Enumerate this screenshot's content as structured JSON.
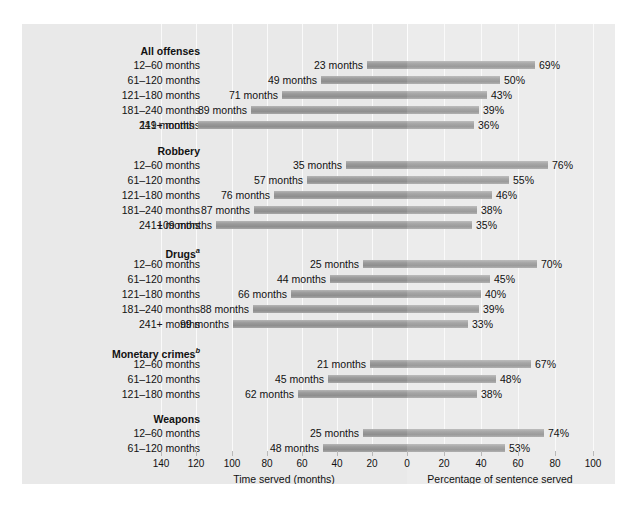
{
  "chart_data": {
    "type": "bar",
    "title": "",
    "orientation": "horizontal-bidirectional",
    "left_axis": {
      "xlabel": "Time served (months)",
      "ticks": [
        140,
        120,
        100,
        80,
        60,
        40,
        20,
        0
      ],
      "direction": "right-to-left",
      "xlim": [
        0,
        140
      ]
    },
    "right_axis": {
      "xlabel": "Percentage of sentence served",
      "ticks": [
        0,
        20,
        40,
        60,
        80,
        100
      ],
      "direction": "left-to-right",
      "xlim": [
        0,
        100
      ]
    },
    "series": [
      {
        "name": "Time served (months)",
        "unit": "months"
      },
      {
        "name": "Percentage of sentence served",
        "unit": "%"
      }
    ],
    "groups": [
      {
        "label": "All offenses",
        "footnote": "",
        "rows": [
          {
            "category": "12–60 months",
            "months": 23,
            "months_label": "23 months",
            "percent": 69,
            "percent_label": "69%"
          },
          {
            "category": "61–120 months",
            "months": 49,
            "months_label": "49 months",
            "percent": 50,
            "percent_label": "50%"
          },
          {
            "category": "121–180 months",
            "months": 71,
            "months_label": "71 months",
            "percent": 43,
            "percent_label": "43%"
          },
          {
            "category": "181–240 months",
            "months": 89,
            "months_label": "89 months",
            "percent": 39,
            "percent_label": "39%"
          },
          {
            "category": "241+ months",
            "months": 119,
            "months_label": "119 months",
            "percent": 36,
            "percent_label": "36%"
          }
        ]
      },
      {
        "label": "Robbery",
        "footnote": "",
        "rows": [
          {
            "category": "12–60 months",
            "months": 35,
            "months_label": "35 months",
            "percent": 76,
            "percent_label": "76%"
          },
          {
            "category": "61–120 months",
            "months": 57,
            "months_label": "57 months",
            "percent": 55,
            "percent_label": "55%"
          },
          {
            "category": "121–180 months",
            "months": 76,
            "months_label": "76 months",
            "percent": 46,
            "percent_label": "46%"
          },
          {
            "category": "181–240 months",
            "months": 87,
            "months_label": "87 months",
            "percent": 38,
            "percent_label": "38%"
          },
          {
            "category": "241+ months",
            "months": 109,
            "months_label": "109 months",
            "percent": 35,
            "percent_label": "35%"
          }
        ]
      },
      {
        "label": "Drugs",
        "footnote": "a",
        "rows": [
          {
            "category": "12–60 months",
            "months": 25,
            "months_label": "25 months",
            "percent": 70,
            "percent_label": "70%"
          },
          {
            "category": "61–120 months",
            "months": 44,
            "months_label": "44 months",
            "percent": 45,
            "percent_label": "45%"
          },
          {
            "category": "121–180 months",
            "months": 66,
            "months_label": "66 months",
            "percent": 40,
            "percent_label": "40%"
          },
          {
            "category": "181–240 months",
            "months": 88,
            "months_label": "88 months",
            "percent": 39,
            "percent_label": "39%"
          },
          {
            "category": "241+ months",
            "months": 99,
            "months_label": "99 months",
            "percent": 33,
            "percent_label": "33%"
          }
        ]
      },
      {
        "label": "Monetary crimes",
        "footnote": "b",
        "rows": [
          {
            "category": "12–60 months",
            "months": 21,
            "months_label": "21 months",
            "percent": 67,
            "percent_label": "67%"
          },
          {
            "category": "61–120 months",
            "months": 45,
            "months_label": "45 months",
            "percent": 48,
            "percent_label": "48%"
          },
          {
            "category": "121–180 months",
            "months": 62,
            "months_label": "62 months",
            "percent": 38,
            "percent_label": "38%"
          }
        ]
      },
      {
        "label": "Weapons",
        "footnote": "",
        "rows": [
          {
            "category": "12–60 months",
            "months": 25,
            "months_label": "25 months",
            "percent": 74,
            "percent_label": "74%"
          },
          {
            "category": "61–120 months",
            "months": 48,
            "months_label": "48 months",
            "percent": 53,
            "percent_label": "53%"
          }
        ]
      }
    ]
  },
  "colors": {
    "panel_background": "#e9e9e9",
    "percent_band": "#ececec",
    "gridline": "#fafafa",
    "bar_left": "#9a9a9a",
    "bar_right": "#a6a6a6",
    "text": "#111111"
  }
}
